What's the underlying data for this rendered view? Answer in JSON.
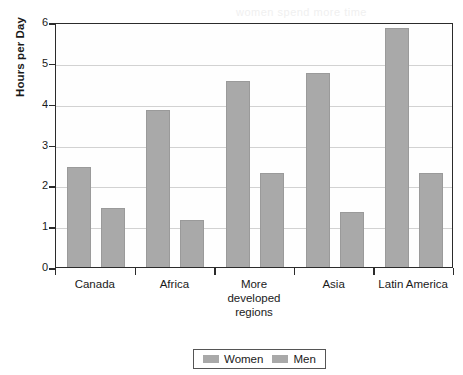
{
  "chart_data": {
    "type": "bar",
    "title": "",
    "xlabel": "",
    "ylabel": "Hours per Day",
    "ylim": [
      0,
      6
    ],
    "yticks": [
      "0",
      "1",
      "2",
      "3",
      "4",
      "5",
      "6"
    ],
    "grid": true,
    "legend_position": "bottom",
    "categories": [
      "Canada",
      "Africa",
      "More\ndeveloped\nregions",
      "Asia",
      "Latin America"
    ],
    "series": [
      {
        "name": "Women",
        "color": "#a9a9a9",
        "values": [
          2.45,
          3.85,
          4.55,
          4.75,
          5.85
        ]
      },
      {
        "name": "Men",
        "color": "#a9a9a9",
        "values": [
          1.45,
          1.15,
          2.3,
          1.35,
          2.3
        ]
      }
    ]
  },
  "legend": {
    "items": [
      {
        "label": "Women"
      },
      {
        "label": "Men"
      }
    ]
  },
  "colors": {
    "bar": "#a9a9a9",
    "axis": "#2b2b2b",
    "grid": "#d2d2d2",
    "background": "#ffffff"
  },
  "bleed_text": {
    "line1": "women spend more time",
    "line2": "in developing countries",
    "line3": "caring for children"
  }
}
